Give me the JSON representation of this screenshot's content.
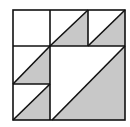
{
  "diagram": {
    "colors": {
      "fill": "#c8c8c8",
      "stroke": "#111111",
      "background": "#ffffff"
    },
    "grid": {
      "x": [
        13,
        50,
        88,
        125
      ],
      "y": [
        10,
        46,
        84,
        120
      ]
    },
    "shaded_triangles": [
      {
        "name": "top-middle",
        "points": "50,46 88,10 88,46"
      },
      {
        "name": "top-right",
        "points": "88,46 125,10 125,46"
      },
      {
        "name": "middle-left",
        "points": "13,84 50,46 50,84"
      },
      {
        "name": "bottom-left",
        "points": "13,120 50,84 50,120"
      },
      {
        "name": "large-center",
        "points": "52,120 125,46 125,120"
      }
    ]
  }
}
